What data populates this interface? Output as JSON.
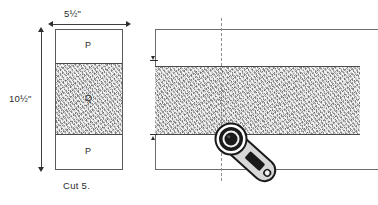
{
  "figure": {
    "caption": "Cut 5."
  },
  "dimensions": {
    "width_label": "5½\"",
    "height_label": "10½\""
  },
  "left_block": {
    "name": "cut-unit",
    "bands": [
      {
        "id": "p-top",
        "label": "P",
        "fill": "plain"
      },
      {
        "id": "q-middle",
        "label": "Q",
        "fill": "textured"
      },
      {
        "id": "p-bottom",
        "label": "P",
        "fill": "plain"
      }
    ]
  },
  "right_strip": {
    "name": "fabric-strip",
    "band_label": "Q",
    "cut_line_style": "dashed",
    "tool": {
      "name": "rotary-cutter",
      "blade": "circular",
      "orientation": "diagonal"
    }
  },
  "colors": {
    "outline": "#5a5a5a",
    "band_outline": "#4a4a4a",
    "texture_fill": "#bdbdbd",
    "plain_fill": "#ffffff",
    "dimension_line": "#3d3d3d",
    "cut_line": "#8f8f8f",
    "tool_dark": "#1a1a1a",
    "tool_light": "#d8d8d8",
    "text": "#2b2b2b"
  }
}
